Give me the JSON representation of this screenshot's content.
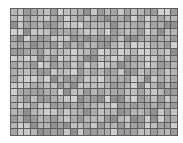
{
  "image": {
    "subject": "grey glass mosaic tile sheet",
    "background_color": "#ffffff",
    "grout_color": "#5e5e5e",
    "grid": {
      "columns": 25,
      "rows": 19
    },
    "tile_palette": [
      "#9a9a9a",
      "#a4a4a4",
      "#adadad",
      "#b6b6b6",
      "#bfbfbf",
      "#c7c7c7",
      "#8f8f8f",
      "#d0d0d0"
    ]
  }
}
